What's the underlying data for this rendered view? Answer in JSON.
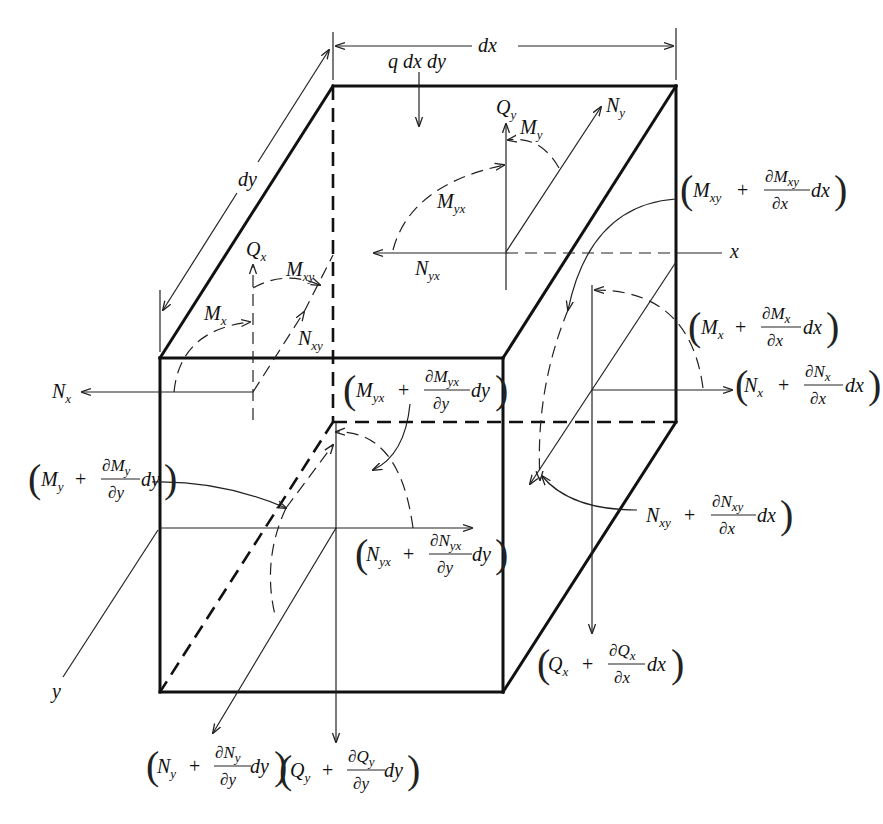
{
  "figure": {
    "dimensions": {
      "dx": "dx",
      "dy": "dy"
    },
    "load": "q dx dy",
    "axes": {
      "x": "x",
      "y": "y"
    }
  },
  "labels": {
    "Qy": {
      "main": "Q",
      "sub": "y"
    },
    "My": {
      "main": "M",
      "sub": "y"
    },
    "Ny": {
      "main": "N",
      "sub": "y"
    },
    "Myx": {
      "main": "M",
      "sub": "yx"
    },
    "Nyx": {
      "main": "N",
      "sub": "yx"
    },
    "Qx": {
      "main": "Q",
      "sub": "x"
    },
    "Mxy": {
      "main": "M",
      "sub": "xy"
    },
    "Mx": {
      "main": "M",
      "sub": "x"
    },
    "Nxy": {
      "main": "N",
      "sub": "xy"
    },
    "Nx": {
      "main": "N",
      "sub": "x"
    }
  },
  "expressions": {
    "Mxy_dx": {
      "base": "M",
      "sub": "xy",
      "num": "∂M",
      "numsub": "xy",
      "den": "∂x",
      "diff": "dx"
    },
    "Mx_dx": {
      "base": "M",
      "sub": "x",
      "num": "∂M",
      "numsub": "x",
      "den": "∂x",
      "diff": "dx"
    },
    "Nx_dx": {
      "base": "N",
      "sub": "x",
      "num": "∂N",
      "numsub": "x",
      "den": "∂x",
      "diff": "dx"
    },
    "Myx_dy": {
      "base": "M",
      "sub": "yx",
      "num": "∂M",
      "numsub": "yx",
      "den": "∂y",
      "diff": "dy"
    },
    "My_dy": {
      "base": "M",
      "sub": "y",
      "num": "∂M",
      "numsub": "y",
      "den": "∂y",
      "diff": "dy"
    },
    "Nyx_dy": {
      "base": "N",
      "sub": "yx",
      "num": "∂N",
      "numsub": "yx",
      "den": "∂y",
      "diff": "dy"
    },
    "Nxy_dx": {
      "base": "N",
      "sub": "xy",
      "num": "∂N",
      "numsub": "xy",
      "den": "∂x",
      "diff": "dx"
    },
    "Qx_dx": {
      "base": "Q",
      "sub": "x",
      "num": "∂Q",
      "numsub": "x",
      "den": "∂x",
      "diff": "dx"
    },
    "Ny_dy": {
      "base": "N",
      "sub": "y",
      "num": "∂N",
      "numsub": "y",
      "den": "∂y",
      "diff": "dy"
    },
    "Qy_dy": {
      "base": "Q",
      "sub": "y",
      "num": "∂Q",
      "numsub": "y",
      "den": "∂y",
      "diff": "dy"
    }
  },
  "symbols": {
    "plus": "+",
    "lparen": "(",
    "rparen": ")"
  }
}
